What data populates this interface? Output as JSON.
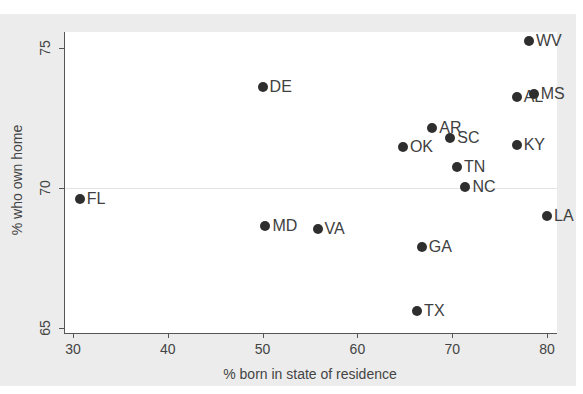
{
  "chart_data": {
    "type": "scatter",
    "title": "",
    "xlabel": "% born in state of residence",
    "ylabel": "% who own home",
    "xlim": [
      29,
      81
    ],
    "ylim": [
      64.8,
      75.6
    ],
    "xticks": [
      30,
      40,
      50,
      60,
      70,
      80
    ],
    "yticks": [
      65,
      70,
      75
    ],
    "grid": "faint horizontal at 70",
    "legend": "none",
    "points": [
      {
        "label": "WV",
        "x": 78.1,
        "y": 75.25
      },
      {
        "label": "DE",
        "x": 50.0,
        "y": 73.6
      },
      {
        "label": "AL",
        "x": 76.8,
        "y": 73.25
      },
      {
        "label": "MS",
        "x": 78.6,
        "y": 73.35
      },
      {
        "label": "AR",
        "x": 67.9,
        "y": 72.15
      },
      {
        "label": "SC",
        "x": 69.8,
        "y": 71.8
      },
      {
        "label": "OK",
        "x": 64.8,
        "y": 71.45
      },
      {
        "label": "KY",
        "x": 76.8,
        "y": 71.55
      },
      {
        "label": "TN",
        "x": 70.5,
        "y": 70.75
      },
      {
        "label": "NC",
        "x": 71.4,
        "y": 70.05
      },
      {
        "label": "FL",
        "x": 30.7,
        "y": 69.6
      },
      {
        "label": "LA",
        "x": 80.0,
        "y": 69.0
      },
      {
        "label": "MD",
        "x": 50.3,
        "y": 68.65
      },
      {
        "label": "VA",
        "x": 55.8,
        "y": 68.55
      },
      {
        "label": "GA",
        "x": 66.8,
        "y": 67.9
      },
      {
        "label": "TX",
        "x": 66.3,
        "y": 65.6
      }
    ]
  },
  "colors": {
    "background": "#ececec",
    "plot": "#ffffff",
    "marker": "#2e2e2e",
    "text": "#444444"
  }
}
